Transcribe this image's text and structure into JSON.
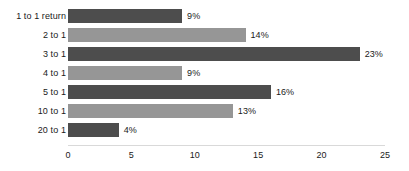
{
  "chart_data": {
    "type": "bar",
    "orientation": "horizontal",
    "title": "",
    "xlabel": "",
    "ylabel": "",
    "categories": [
      "1 to 1 return",
      "2 to 1",
      "3 to 1",
      "4 to 1",
      "5 to 1",
      "10 to 1",
      "20 to 1"
    ],
    "values": [
      9,
      14,
      23,
      9,
      16,
      13,
      4
    ],
    "value_labels": [
      "9%",
      "14%",
      "23%",
      "9%",
      "16%",
      "13%",
      "4%"
    ],
    "xlim": [
      0,
      25
    ],
    "xticks": [
      0,
      5,
      10,
      15,
      20,
      25
    ],
    "xtick_labels": [
      "0",
      "5",
      "10",
      "15",
      "20",
      "25"
    ],
    "grid": false,
    "legend": "none",
    "bar_colors": [
      "#4d4d4d",
      "#969696",
      "#4d4d4d",
      "#969696",
      "#4d4d4d",
      "#969696",
      "#4d4d4d"
    ],
    "axis_line_color": "#d9d9d9",
    "text_color": "#1a1a1a",
    "background_color": "#ffffff"
  },
  "layout": {
    "origin_x": 68,
    "px_per_unit": 12.68,
    "first_bar_top": 9,
    "row_pitch": 19,
    "bar_height": 14,
    "axis_y": 145,
    "tick_label_y": 150
  }
}
